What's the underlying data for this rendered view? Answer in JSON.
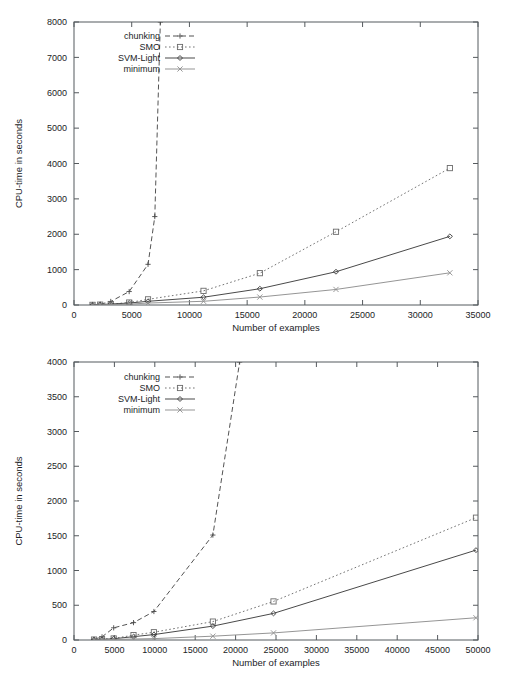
{
  "page": {
    "background": "#ffffff",
    "figure_count": 2
  },
  "common": {
    "xlabel": "Number of examples",
    "ylabel": "CPU-time in seconds",
    "legend_entries": [
      "chunking",
      "SMO",
      "SVM-Light",
      "minimum"
    ],
    "series_colors": {
      "chunking": "#4a4a4a",
      "SMO": "#6b6b6b",
      "SVM-Light": "#3f3f3f",
      "minimum": "#8f8f8f"
    },
    "frame_color": "#555a5e"
  },
  "chart_data": [
    {
      "id": "top",
      "type": "line",
      "title": "",
      "xlabel": "Number of examples",
      "ylabel": "CPU-time in seconds",
      "xlim": [
        0,
        35000
      ],
      "ylim": [
        0,
        8000
      ],
      "xticks": [
        0,
        5000,
        10000,
        15000,
        20000,
        25000,
        30000,
        35000
      ],
      "yticks": [
        0,
        1000,
        2000,
        3000,
        4000,
        5000,
        6000,
        7000,
        8000
      ],
      "xtick_labels": [
        "0",
        "5000",
        "10000",
        "15000",
        "20000",
        "25000",
        "30000",
        "35000"
      ],
      "ytick_labels": [
        "0",
        "1000",
        "2000",
        "3000",
        "4000",
        "5000",
        "6000",
        "7000",
        "8000"
      ],
      "grid": false,
      "legend_position": "top-left",
      "series": [
        {
          "name": "chunking",
          "marker": "plus",
          "dash": "dashed",
          "x": [
            1605,
            2265,
            3185,
            4781,
            6414,
            7000,
            7480
          ],
          "y": [
            3,
            20,
            100,
            380,
            1150,
            2500,
            8000
          ]
        },
        {
          "name": "SMO",
          "marker": "square",
          "dash": "dotted",
          "x": [
            1605,
            2265,
            3185,
            4781,
            6414,
            11221,
            16101,
            22697,
            32562
          ],
          "y": [
            4,
            10,
            26,
            70,
            160,
            400,
            900,
            2070,
            3870
          ]
        },
        {
          "name": "SVM-Light",
          "marker": "diamond",
          "dash": "solid",
          "x": [
            1605,
            2265,
            3185,
            4781,
            6414,
            11221,
            16101,
            22697,
            32562
          ],
          "y": [
            5,
            12,
            28,
            55,
            105,
            220,
            460,
            940,
            1940
          ]
        },
        {
          "name": "minimum",
          "marker": "cross",
          "dash": "solid",
          "x": [
            1605,
            2265,
            3185,
            4781,
            6414,
            11221,
            16101,
            22697,
            32562
          ],
          "y": [
            2,
            5,
            12,
            25,
            55,
            105,
            225,
            440,
            910
          ]
        }
      ]
    },
    {
      "id": "bottom",
      "type": "line",
      "title": "",
      "xlabel": "Number of examples",
      "ylabel": "CPU-time in seconds",
      "xlim": [
        0,
        50000
      ],
      "ylim": [
        0,
        4000
      ],
      "xticks": [
        0,
        5000,
        10000,
        15000,
        20000,
        25000,
        30000,
        35000,
        40000,
        45000,
        50000
      ],
      "yticks": [
        0,
        500,
        1000,
        1500,
        2000,
        2500,
        3000,
        3500,
        4000
      ],
      "xtick_labels": [
        "0",
        "5000",
        "10000",
        "15000",
        "20000",
        "25000",
        "30000",
        "35000",
        "40000",
        "45000",
        "50000"
      ],
      "ytick_labels": [
        "0",
        "500",
        "1000",
        "1500",
        "2000",
        "2500",
        "3000",
        "3500",
        "4000"
      ],
      "grid": false,
      "legend_position": "top-left",
      "series": [
        {
          "name": "chunking",
          "marker": "plus",
          "dash": "dashed",
          "x": [
            2477,
            3470,
            4912,
            7366,
            9888,
            17188,
            20500
          ],
          "y": [
            10,
            45,
            175,
            250,
            410,
            1510,
            4000
          ]
        },
        {
          "name": "SMO",
          "marker": "square",
          "dash": "dotted",
          "x": [
            2477,
            3470,
            4912,
            7366,
            9888,
            17188,
            24692,
            49749
          ],
          "y": [
            6,
            12,
            22,
            70,
            112,
            265,
            555,
            1760
          ]
        },
        {
          "name": "SVM-Light",
          "marker": "diamond",
          "dash": "solid",
          "x": [
            2477,
            3470,
            4912,
            7366,
            9888,
            17188,
            24692,
            49749
          ],
          "y": [
            5,
            10,
            18,
            48,
            78,
            200,
            383,
            1293
          ]
        },
        {
          "name": "minimum",
          "marker": "cross",
          "dash": "solid",
          "x": [
            2477,
            3470,
            4912,
            7366,
            9888,
            17188,
            24692,
            49749
          ],
          "y": [
            2,
            4,
            8,
            14,
            20,
            55,
            102,
            320
          ]
        }
      ]
    }
  ]
}
